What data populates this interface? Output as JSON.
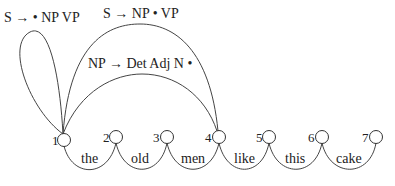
{
  "diagram": {
    "type": "chart-parse-diagram",
    "nodes": [
      {
        "id": 1,
        "label": "1",
        "cx": 64,
        "cy": 140
      },
      {
        "id": 2,
        "label": "2",
        "cx": 116,
        "cy": 137
      },
      {
        "id": 3,
        "label": "3",
        "cx": 167,
        "cy": 137
      },
      {
        "id": 4,
        "label": "4",
        "cx": 219,
        "cy": 137
      },
      {
        "id": 5,
        "label": "5",
        "cx": 269,
        "cy": 137
      },
      {
        "id": 6,
        "label": "6",
        "cx": 322,
        "cy": 137
      },
      {
        "id": 7,
        "label": "7",
        "cx": 376,
        "cy": 137
      }
    ],
    "words": [
      {
        "text": "the",
        "x": 89,
        "y": 161
      },
      {
        "text": "old",
        "x": 140,
        "y": 161
      },
      {
        "text": "men",
        "x": 192,
        "y": 161
      },
      {
        "text": "like",
        "x": 243,
        "y": 161
      },
      {
        "text": "this",
        "x": 295,
        "y": 161
      },
      {
        "text": "cake",
        "x": 348,
        "y": 161
      }
    ],
    "edges": [
      {
        "from": 1,
        "to": 1,
        "label": "S → • NP VP",
        "label_x": 4,
        "label_y": 22,
        "kind": "self-loop"
      },
      {
        "from": 1,
        "to": 4,
        "label": "S → NP • VP",
        "label_x": 103,
        "label_y": 17,
        "kind": "outer-arc"
      },
      {
        "from": 1,
        "to": 4,
        "label": "NP → Det Adj N •",
        "label_x": 88,
        "label_y": 66,
        "kind": "inner-arc"
      }
    ]
  }
}
